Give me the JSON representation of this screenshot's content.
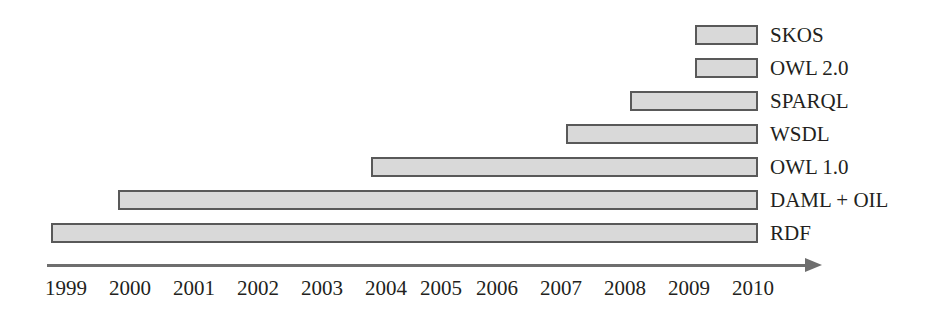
{
  "chart_data": {
    "type": "bar",
    "orientation": "horizontal",
    "subtype": "gantt-timeline",
    "title": "",
    "xlabel": "",
    "ylabel": "",
    "xlim": [
      1999,
      2010
    ],
    "grid": false,
    "legend": "right-of-bars",
    "axis": {
      "tick_labels": [
        "1999",
        "2000",
        "2001",
        "2002",
        "2003",
        "2004",
        "2005",
        "2006",
        "2007",
        "2008",
        "2009",
        "2010"
      ],
      "tick_values": [
        1999,
        2000,
        2001,
        2002,
        2003,
        2004,
        2005,
        2006,
        2007,
        2008,
        2009,
        2010
      ],
      "arrow": true,
      "arrow_direction": "right",
      "line_color": "#6e6e6e"
    },
    "categories": [
      "SKOS",
      "OWL 2.0",
      "SPARQL",
      "WSDL",
      "OWL 1.0",
      "DAML + OIL",
      "RDF"
    ],
    "bars": [
      {
        "label": "SKOS",
        "start": 2009.1,
        "end": 2010.0
      },
      {
        "label": "OWL 2.0",
        "start": 2009.1,
        "end": 2010.0
      },
      {
        "label": "SPARQL",
        "start": 2008.1,
        "end": 2010.0
      },
      {
        "label": "WSDL",
        "start": 2007.1,
        "end": 2010.0
      },
      {
        "label": "OWL 1.0",
        "start": 2004.1,
        "end": 2010.0
      },
      {
        "label": "DAML + OIL",
        "start": 2000.1,
        "end": 2010.0
      },
      {
        "label": "RDF",
        "start": 1999.1,
        "end": 2010.0
      }
    ],
    "colors": {
      "bar_fill": "#d9d9d9",
      "bar_border": "#595959",
      "axis": "#6e6e6e",
      "text": "#231f20"
    }
  },
  "geometry": {
    "bars_px": [
      {
        "left": 695,
        "top": 25,
        "width": 63
      },
      {
        "left": 695,
        "top": 58,
        "width": 63
      },
      {
        "left": 630,
        "top": 91,
        "width": 128
      },
      {
        "left": 566,
        "top": 124,
        "width": 192
      },
      {
        "left": 371,
        "top": 157,
        "width": 387
      },
      {
        "left": 118,
        "top": 190,
        "width": 640
      },
      {
        "left": 51,
        "top": 223,
        "width": 707
      }
    ],
    "tick_centers_px": [
      66,
      130,
      194,
      258,
      322,
      386,
      441,
      497,
      561,
      625,
      689,
      753
    ]
  }
}
